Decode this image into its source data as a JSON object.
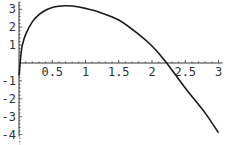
{
  "chart_data": {
    "type": "line",
    "title": "",
    "xlabel": "",
    "ylabel": "",
    "xlim": [
      0,
      3
    ],
    "ylim": [
      -4,
      3.3
    ],
    "grid": false,
    "legend": null,
    "x_ticks": [
      "0.5",
      "1",
      "1.5",
      "2",
      "2.5",
      "3"
    ],
    "y_ticks": [
      "3",
      "2",
      "1",
      "-1",
      "-2",
      "-3",
      "-4"
    ],
    "series": [
      {
        "name": "f(x)",
        "x": [
          0.0,
          0.01,
          0.03,
          0.05,
          0.1,
          0.2,
          0.3,
          0.4,
          0.5,
          0.6,
          0.7,
          0.8,
          1.0,
          1.2,
          1.5,
          1.8,
          2.0,
          2.2,
          2.5,
          2.8,
          3.0
        ],
        "y": [
          -0.7,
          -0.3,
          0.5,
          1.0,
          1.6,
          2.3,
          2.7,
          2.95,
          3.1,
          3.17,
          3.2,
          3.18,
          3.05,
          2.85,
          2.4,
          1.6,
          0.95,
          0.1,
          -1.4,
          -2.8,
          -3.9
        ]
      }
    ],
    "colors": {
      "line": "#1a1a1a",
      "axis": "#333333"
    }
  }
}
